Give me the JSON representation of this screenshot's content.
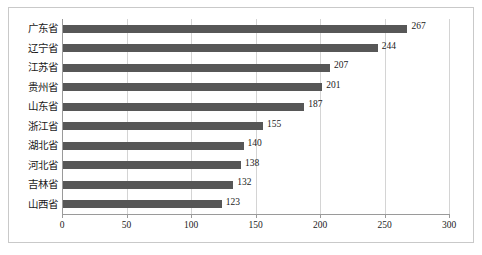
{
  "chart_data": {
    "type": "bar",
    "orientation": "horizontal",
    "title": "",
    "subtitle": "",
    "xlabel": "",
    "ylabel": "",
    "categories": [
      "广东省",
      "辽宁省",
      "江苏省",
      "贵州省",
      "山东省",
      "浙江省",
      "湖北省",
      "河北省",
      "吉林省",
      "山西省"
    ],
    "values": [
      267,
      244,
      207,
      201,
      187,
      155,
      140,
      138,
      132,
      123
    ],
    "xlim": [
      0,
      300
    ],
    "xticks": [
      0,
      50,
      100,
      150,
      200,
      250,
      300
    ],
    "xtick_labels": [
      "0",
      "50",
      "100",
      "150",
      "200",
      "250",
      "300"
    ],
    "grid": true,
    "grid_axis": "x",
    "legend": false,
    "data_labels": true,
    "bar_color": "#575757",
    "gridline_color": "#d4d4d4",
    "axis_color": "#9a9a9a",
    "border_color": "#c9c9c9",
    "background_color": "#ffffff"
  }
}
